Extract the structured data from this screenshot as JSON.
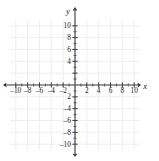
{
  "figure": {
    "kind": "cartesian-coordinate-plane",
    "title": "",
    "background_color": "#ffffff",
    "axis_color": "#3a3a3a",
    "grid_color": "#ececed",
    "label_color": "#222222"
  },
  "axes": {
    "x_axis_name": "x",
    "y_axis_name": "y",
    "x_range": [
      -11,
      11
    ],
    "y_range": [
      -11,
      11
    ],
    "grid_step": 2,
    "minor_tick_step": 1,
    "major_tick_step": 2,
    "arrowheads": [
      "left",
      "right",
      "up",
      "down"
    ]
  },
  "x_tick_labels": [
    {
      "value": -10,
      "text": "–10"
    },
    {
      "value": -8,
      "text": "–8"
    },
    {
      "value": -6,
      "text": "–6"
    },
    {
      "value": -4,
      "text": "–4"
    },
    {
      "value": -2,
      "text": "–2"
    },
    {
      "value": 2,
      "text": "2"
    },
    {
      "value": 4,
      "text": "4"
    },
    {
      "value": 6,
      "text": "6"
    },
    {
      "value": 8,
      "text": "8"
    },
    {
      "value": 10,
      "text": "10"
    }
  ],
  "y_tick_labels": [
    {
      "value": 10,
      "text": "10"
    },
    {
      "value": 8,
      "text": "8"
    },
    {
      "value": 6,
      "text": "6"
    },
    {
      "value": 4,
      "text": "4"
    },
    {
      "value": -2,
      "text": "2"
    },
    {
      "value": -4,
      "text": "–4"
    },
    {
      "value": -6,
      "text": "–6"
    },
    {
      "value": -8,
      "text": "–8"
    },
    {
      "value": -10,
      "text": "–10"
    }
  ],
  "chart_data": {
    "type": "scatter",
    "title": "",
    "xlabel": "x",
    "ylabel": "y",
    "xlim": [
      -11,
      11
    ],
    "ylim": [
      -11,
      11
    ],
    "xticks": [
      -10,
      -8,
      -6,
      -4,
      -2,
      0,
      2,
      4,
      6,
      8,
      10
    ],
    "yticks": [
      -10,
      -8,
      -6,
      -4,
      -2,
      0,
      2,
      4,
      6,
      8,
      10
    ],
    "xticklabels": [
      "–10",
      "–8",
      "–6",
      "–4",
      "–2",
      "",
      "2",
      "4",
      "6",
      "8",
      "10"
    ],
    "yticklabels": [
      "–10",
      "–8",
      "–6",
      "–4",
      "2",
      "",
      "",
      "4",
      "6",
      "8",
      "10"
    ],
    "grid": true,
    "grid_step": 2,
    "legend": null,
    "series": [],
    "x": [],
    "values": [],
    "annotations": [],
    "note": "Empty coordinate grid — no data points, curves, or shaded regions are plotted."
  }
}
